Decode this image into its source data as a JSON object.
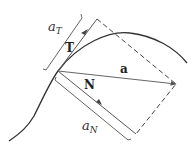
{
  "diagram": {
    "title": "",
    "labels": {
      "tangential_component": "a",
      "tangential_sub": "T",
      "normal_component": "a",
      "normal_sub": "N",
      "unit_tangent": "T",
      "unit_normal": "N",
      "acceleration": "a"
    },
    "colors": {
      "curve": "#333333",
      "vector": "#555555",
      "dashed": "#444444"
    }
  }
}
